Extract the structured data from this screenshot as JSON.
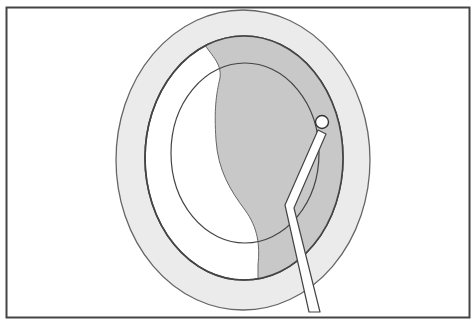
{
  "figure": {
    "colors": {
      "frame": "#444444",
      "outer_ring": "#ebebeb",
      "shaded_region": "#c8c8c8",
      "outline": "#555555",
      "background": "#ffffff"
    }
  }
}
